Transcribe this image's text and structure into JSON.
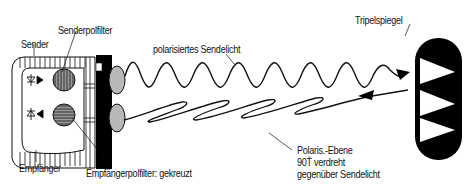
{
  "diagram": {
    "labels": {
      "sender": "Sender",
      "sender_filter": "Senderpolfilter",
      "receiver": "Empfänger",
      "receiver_filter": "Empfängerpolfilter: gekreuzt",
      "emitted_light": "polarisiertes Sendelicht",
      "reflector": "Tripelspiegel",
      "returned_line1": "Polaris.-Ebene",
      "returned_line2": "90Ť verdreht",
      "returned_line3": "gegenüber Sendelicht"
    },
    "components": [
      {
        "id": "sender",
        "icon": "led-emitter-icon"
      },
      {
        "id": "receiver",
        "icon": "photodiode-icon"
      },
      {
        "id": "sender_polfilter",
        "pattern": "vertical-stripes"
      },
      {
        "id": "receiver_polfilter",
        "pattern": "horizontal-stripes"
      },
      {
        "id": "tripelspiegel",
        "icon": "retroreflector-icon"
      }
    ],
    "colors": {
      "line": "#111111",
      "fill_dark": "#000000",
      "lens_gray": "#b8b8b8",
      "filter_gray": "#9a9a9a",
      "background": "#ffffff"
    }
  }
}
